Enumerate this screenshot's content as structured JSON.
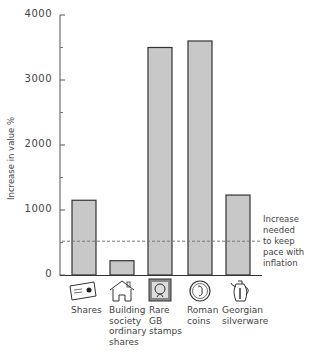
{
  "chart_data": {
    "type": "bar",
    "title": "",
    "xlabel": "",
    "ylabel": "Increase in value %",
    "ylim": [
      0,
      4000
    ],
    "yticks": [
      0,
      1000,
      2000,
      3000,
      4000
    ],
    "grid": false,
    "categories": [
      "Shares",
      "Building society ordinary shares",
      "Rare GB stamps",
      "Roman coins",
      "Georgian silverware"
    ],
    "category_lines": [
      [
        "Shares"
      ],
      [
        "Building",
        "society",
        "ordinary",
        "shares"
      ],
      [
        "Rare",
        "GB",
        "stamps"
      ],
      [
        "Roman",
        "coins"
      ],
      [
        "Georgian",
        "silverware"
      ]
    ],
    "values": [
      1150,
      220,
      3500,
      3600,
      1230
    ],
    "icons": [
      "share-certificate-icon",
      "house-icon",
      "stamp-icon",
      "coin-icon",
      "coffee-pot-icon"
    ],
    "reference_line": {
      "value": 520,
      "style": "dashed",
      "label": "Increase needed to keep pace with inflation",
      "label_lines": [
        "Increase",
        "needed",
        "to keep",
        "pace with",
        "inflation"
      ]
    },
    "bar_color": "#c8c8c8",
    "bar_edge": "#333333"
  }
}
